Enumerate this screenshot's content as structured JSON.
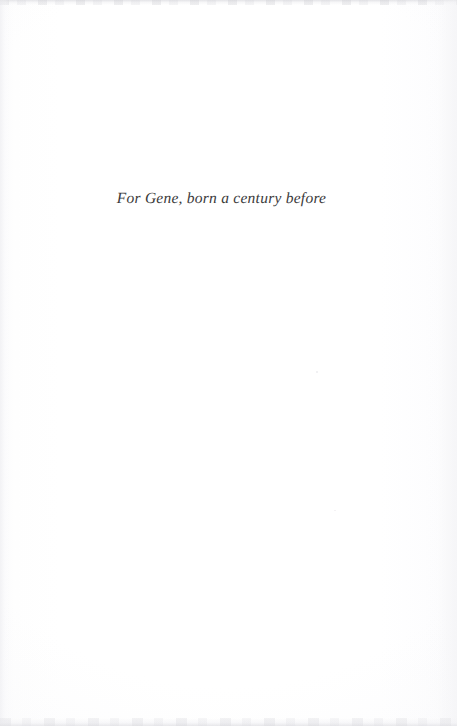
{
  "page": {
    "kind": "book-dedication-page",
    "width": 457,
    "height": 726,
    "background_color": "#fefefe",
    "paper_tone": "#fdfdfe"
  },
  "dedication": {
    "text": "For Gene, born a century before",
    "style": "italic",
    "color": "#2c2b2c",
    "alignment": "center"
  },
  "artifacts": {
    "top_edge_label": "scan-edge-top",
    "bottom_edge_label": "scan-edge-bottom",
    "left_edge_label": "scan-edge-left",
    "right_edge_label": "scan-edge-right"
  }
}
